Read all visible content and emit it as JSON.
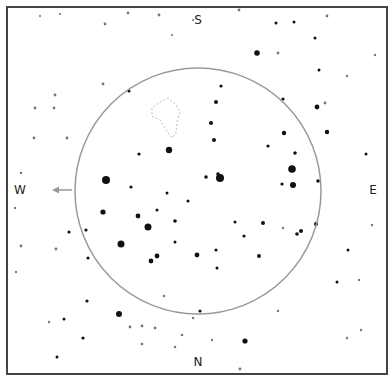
{
  "chart_data": {
    "type": "scatter",
    "title": "",
    "frame": {
      "x": 7,
      "y": 7,
      "width": 380,
      "height": 367,
      "stroke": "#444444"
    },
    "directions": {
      "top": "S",
      "bottom": "N",
      "left": "W",
      "right": "E"
    },
    "circle": {
      "cx": 198,
      "cy": 191,
      "r": 123,
      "stroke": "#999999"
    },
    "arrow": {
      "from": [
        72,
        190
      ],
      "to": [
        52,
        190
      ],
      "color": "#999999",
      "direction": "W"
    },
    "constellation_outline": {
      "stroke": "#bbbbbb",
      "points": [
        [
          160,
          102
        ],
        [
          168,
          98
        ],
        [
          176,
          105
        ],
        [
          180,
          112
        ],
        [
          177,
          122
        ],
        [
          176,
          133
        ],
        [
          172,
          138
        ],
        [
          166,
          130
        ],
        [
          160,
          120
        ],
        [
          152,
          116
        ],
        [
          152,
          108
        ],
        [
          160,
          102
        ]
      ]
    },
    "stars": [
      {
        "x": 220,
        "y": 178,
        "r": 4
      },
      {
        "x": 106,
        "y": 180,
        "r": 4
      },
      {
        "x": 292,
        "y": 169,
        "r": 3.8
      },
      {
        "x": 148,
        "y": 227,
        "r": 3.5
      },
      {
        "x": 121,
        "y": 244,
        "r": 3.5
      },
      {
        "x": 169,
        "y": 150,
        "r": 3.2
      },
      {
        "x": 293,
        "y": 185,
        "r": 3
      },
      {
        "x": 119,
        "y": 314,
        "r": 3
      },
      {
        "x": 257,
        "y": 53,
        "r": 2.8
      },
      {
        "x": 245,
        "y": 341,
        "r": 2.6
      },
      {
        "x": 103,
        "y": 212,
        "r": 2.6
      },
      {
        "x": 138,
        "y": 216,
        "r": 2.4
      },
      {
        "x": 157,
        "y": 256,
        "r": 2.4
      },
      {
        "x": 151,
        "y": 261,
        "r": 2.4
      },
      {
        "x": 197,
        "y": 255,
        "r": 2.4
      },
      {
        "x": 317,
        "y": 107,
        "r": 2.4
      },
      {
        "x": 284,
        "y": 133,
        "r": 2.2
      },
      {
        "x": 327,
        "y": 132,
        "r": 2.2
      },
      {
        "x": 216,
        "y": 102,
        "r": 2
      },
      {
        "x": 211,
        "y": 123,
        "r": 2
      },
      {
        "x": 214,
        "y": 140,
        "r": 2
      },
      {
        "x": 206,
        "y": 177,
        "r": 1.8
      },
      {
        "x": 218,
        "y": 174,
        "r": 1.8
      },
      {
        "x": 175,
        "y": 221,
        "r": 1.8
      },
      {
        "x": 259,
        "y": 256,
        "r": 2
      },
      {
        "x": 301,
        "y": 231,
        "r": 2
      },
      {
        "x": 297,
        "y": 234,
        "r": 1.8
      },
      {
        "x": 316,
        "y": 224,
        "r": 2
      },
      {
        "x": 263,
        "y": 223,
        "r": 2
      },
      {
        "x": 295,
        "y": 153,
        "r": 1.8
      },
      {
        "x": 318,
        "y": 181,
        "r": 1.8
      },
      {
        "x": 268,
        "y": 146,
        "r": 1.6
      },
      {
        "x": 283,
        "y": 99,
        "r": 1.6
      },
      {
        "x": 221,
        "y": 86,
        "r": 1.6
      },
      {
        "x": 129,
        "y": 91,
        "r": 1.6
      },
      {
        "x": 139,
        "y": 154,
        "r": 1.6
      },
      {
        "x": 131,
        "y": 187,
        "r": 1.6
      },
      {
        "x": 86,
        "y": 230,
        "r": 1.6
      },
      {
        "x": 88,
        "y": 258,
        "r": 1.6
      },
      {
        "x": 69,
        "y": 232,
        "r": 1.6
      },
      {
        "x": 87,
        "y": 301,
        "r": 1.6
      },
      {
        "x": 83,
        "y": 338,
        "r": 1.6
      },
      {
        "x": 64,
        "y": 319,
        "r": 1.5
      },
      {
        "x": 57,
        "y": 357,
        "r": 1.5
      },
      {
        "x": 216,
        "y": 250,
        "r": 1.6
      },
      {
        "x": 217,
        "y": 268,
        "r": 1.5
      },
      {
        "x": 244,
        "y": 236,
        "r": 1.6
      },
      {
        "x": 282,
        "y": 184,
        "r": 1.6
      },
      {
        "x": 200,
        "y": 311,
        "r": 1.6
      },
      {
        "x": 175,
        "y": 242,
        "r": 1.5
      },
      {
        "x": 188,
        "y": 201,
        "r": 1.5
      },
      {
        "x": 167,
        "y": 193,
        "r": 1.5
      },
      {
        "x": 157,
        "y": 210,
        "r": 1.5
      },
      {
        "x": 235,
        "y": 222,
        "r": 1.5
      },
      {
        "x": 366,
        "y": 154,
        "r": 1.5
      },
      {
        "x": 348,
        "y": 250,
        "r": 1.5
      },
      {
        "x": 337,
        "y": 282,
        "r": 1.5
      },
      {
        "x": 319,
        "y": 70,
        "r": 1.5
      },
      {
        "x": 315,
        "y": 38,
        "r": 1.5
      },
      {
        "x": 294,
        "y": 22,
        "r": 1.5
      },
      {
        "x": 276,
        "y": 23,
        "r": 1.5
      },
      {
        "x": 325,
        "y": 103,
        "r": 1.4
      },
      {
        "x": 278,
        "y": 53,
        "r": 1.4
      },
      {
        "x": 54,
        "y": 108,
        "r": 1.4
      },
      {
        "x": 35,
        "y": 108,
        "r": 1.4
      },
      {
        "x": 55,
        "y": 95,
        "r": 1.4
      },
      {
        "x": 34,
        "y": 138,
        "r": 1.4
      },
      {
        "x": 103,
        "y": 84,
        "r": 1.4
      },
      {
        "x": 67,
        "y": 138,
        "r": 1.4
      },
      {
        "x": 21,
        "y": 246,
        "r": 1.4
      },
      {
        "x": 56,
        "y": 249,
        "r": 1.4
      },
      {
        "x": 128,
        "y": 13,
        "r": 1.4
      },
      {
        "x": 105,
        "y": 24,
        "r": 1.4
      },
      {
        "x": 159,
        "y": 15,
        "r": 1.4
      },
      {
        "x": 239,
        "y": 10,
        "r": 1.4
      },
      {
        "x": 327,
        "y": 16,
        "r": 1.4
      },
      {
        "x": 155,
        "y": 328,
        "r": 1.4
      },
      {
        "x": 240,
        "y": 369,
        "r": 1.4
      },
      {
        "x": 130,
        "y": 327,
        "r": 1.4
      },
      {
        "x": 142,
        "y": 326,
        "r": 1.4
      },
      {
        "x": 142,
        "y": 344,
        "r": 1.3
      },
      {
        "x": 175,
        "y": 347,
        "r": 1.3
      },
      {
        "x": 182,
        "y": 335,
        "r": 1.3
      },
      {
        "x": 16,
        "y": 272,
        "r": 1.2
      },
      {
        "x": 21,
        "y": 173,
        "r": 1.2
      },
      {
        "x": 15,
        "y": 208,
        "r": 1.2
      },
      {
        "x": 49,
        "y": 322,
        "r": 1.2
      },
      {
        "x": 361,
        "y": 330,
        "r": 1.2
      },
      {
        "x": 359,
        "y": 280,
        "r": 1.2
      },
      {
        "x": 372,
        "y": 225,
        "r": 1.2
      },
      {
        "x": 347,
        "y": 338,
        "r": 1.2
      },
      {
        "x": 212,
        "y": 340,
        "r": 1.2
      },
      {
        "x": 193,
        "y": 318,
        "r": 1.2
      },
      {
        "x": 164,
        "y": 296,
        "r": 1.2
      },
      {
        "x": 278,
        "y": 311,
        "r": 1.2
      },
      {
        "x": 283,
        "y": 228,
        "r": 1.2
      },
      {
        "x": 347,
        "y": 76,
        "r": 1.2
      },
      {
        "x": 375,
        "y": 55,
        "r": 1.2
      },
      {
        "x": 40,
        "y": 16,
        "r": 1.1
      },
      {
        "x": 60,
        "y": 14,
        "r": 1.1
      },
      {
        "x": 172,
        "y": 35,
        "r": 1.1
      },
      {
        "x": 193,
        "y": 20,
        "r": 1.1
      }
    ]
  }
}
